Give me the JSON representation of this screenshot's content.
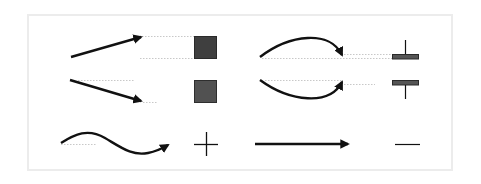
{
  "diagram": {
    "colors": {
      "stroke": "#111111",
      "dotted_guide": "#c8c8c8",
      "square_dark": "#3f3f3f",
      "square_medium": "#515151",
      "bar_fill": "#555555",
      "frame_border": "#ececec"
    },
    "rows": [
      {
        "left_glyph": "rising-straight-arrow",
        "left_symbol": "dark-filled-square",
        "right_glyph": "arc-up-arrow",
        "right_symbol": "bar-with-upper-stem"
      },
      {
        "left_glyph": "falling-straight-arrow",
        "left_symbol": "medium-filled-square",
        "right_glyph": "arc-down-arrow",
        "right_symbol": "bar-with-lower-stem"
      },
      {
        "left_glyph": "wave-arrow",
        "left_symbol": "plus-sign",
        "right_glyph": "flat-arrow",
        "right_symbol": "minus-sign"
      }
    ]
  }
}
